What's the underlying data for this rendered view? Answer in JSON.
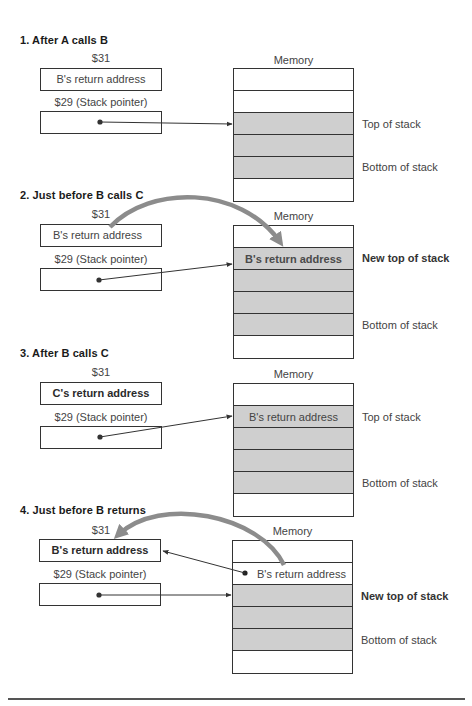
{
  "colors": {
    "stack_fill": "#cfcfcf",
    "border": "#333333",
    "arc": "#8c8c8c"
  },
  "sections": [
    {
      "title": "1. After A calls B",
      "reg31_label": "$31",
      "reg31_value": "B's return address",
      "reg29_label": "$29 (Stack pointer)",
      "reg29_value": "",
      "memory_label": "Memory",
      "memory_cells": [
        "",
        "",
        "",
        "",
        "",
        ""
      ],
      "side_labels": {
        "top": "Top of stack",
        "bottom": "Bottom of stack"
      }
    },
    {
      "title": "2. Just before B calls C",
      "reg31_label": "$31",
      "reg31_value": "B's return address",
      "reg29_label": "$29 (Stack pointer)",
      "reg29_value": "",
      "memory_label": "Memory",
      "memory_cells": [
        "",
        "B's return address",
        "",
        "",
        "",
        ""
      ],
      "side_labels": {
        "top": "New top of stack",
        "bottom": "Bottom of stack"
      }
    },
    {
      "title": "3. After B calls C",
      "reg31_label": "$31",
      "reg31_value": "C's return address",
      "reg29_label": "$29 (Stack pointer)",
      "reg29_value": "",
      "memory_label": "Memory",
      "memory_cells": [
        "",
        "B's return address",
        "",
        "",
        "",
        ""
      ],
      "side_labels": {
        "top": "Top of stack",
        "bottom": "Bottom of stack"
      }
    },
    {
      "title": "4. Just before B returns",
      "reg31_label": "$31",
      "reg31_value": "B's return address",
      "reg29_label": "$29 (Stack pointer)",
      "reg29_value": "",
      "memory_label": "Memory",
      "memory_cells": [
        "",
        "B's return address",
        "",
        "",
        "",
        ""
      ],
      "side_labels": {
        "top": "New top of stack",
        "bottom": "Bottom of stack"
      }
    }
  ]
}
